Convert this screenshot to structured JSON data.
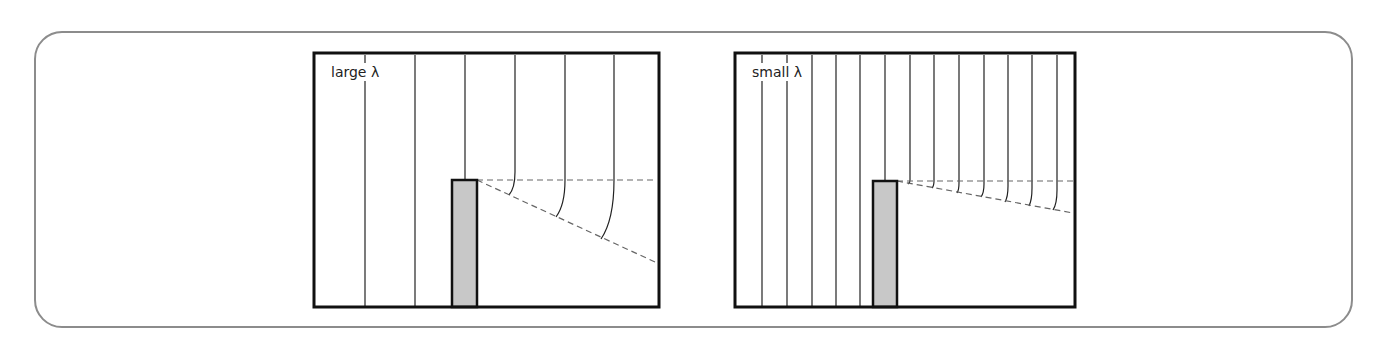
{
  "figure": {
    "colors": {
      "frame": "#8c8c8c",
      "panel_border": "#111111",
      "wavefront": "#222222",
      "barrier_fill": "#c8c8c8",
      "shadow_boundary": "#666666"
    }
  },
  "panels": [
    {
      "label": "large λ",
      "wavefronts_x": [
        365,
        415,
        465,
        515,
        565,
        614
      ],
      "diffracted": [
        {
          "x": 515,
          "end_x": 509,
          "end_y": 195
        },
        {
          "x": 565,
          "end_x": 556,
          "end_y": 217
        },
        {
          "x": 614,
          "end_x": 601,
          "end_y": 239
        }
      ],
      "barrier": {
        "x": 452,
        "y": 180,
        "w": 25,
        "h": 127
      },
      "shadow_line_end": {
        "x": 655,
        "y": 262
      }
    },
    {
      "label": "small λ",
      "wavefronts_x": [
        762,
        787,
        812,
        836,
        860,
        885,
        910,
        934,
        959,
        984,
        1008,
        1032,
        1057
      ],
      "diffracted": [
        {
          "x": 910,
          "end_x": 908,
          "end_y": 184
        },
        {
          "x": 934,
          "end_x": 932,
          "end_y": 188
        },
        {
          "x": 959,
          "end_x": 957,
          "end_y": 193
        },
        {
          "x": 984,
          "end_x": 981,
          "end_y": 197
        },
        {
          "x": 1008,
          "end_x": 1005,
          "end_y": 202
        },
        {
          "x": 1032,
          "end_x": 1029,
          "end_y": 206
        },
        {
          "x": 1057,
          "end_x": 1053,
          "end_y": 210
        }
      ],
      "barrier": {
        "x": 873,
        "y": 181,
        "w": 24,
        "h": 126
      },
      "shadow_line_end": {
        "x": 1073,
        "y": 213
      }
    }
  ]
}
